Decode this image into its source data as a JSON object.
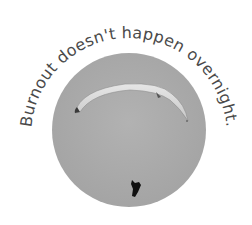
{
  "badge": {
    "caption": "Burnout doesn't happen overnight.",
    "photo": {
      "subject": "paraglider-in-grey-sky",
      "circle_color": "#a9a9a9",
      "canopy_color": "#dcdcdc",
      "pilot_color": "#111111"
    },
    "text_color": "#4a4a4a"
  }
}
